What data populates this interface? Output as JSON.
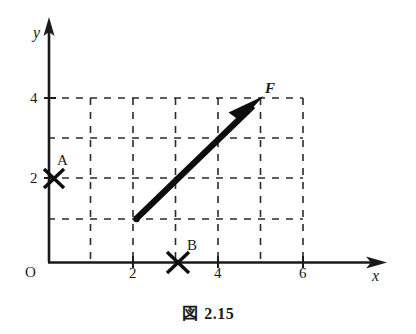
{
  "figure": {
    "caption_kanji": "図",
    "caption_number": "2.15",
    "caption_full": "図 2.15"
  },
  "axes": {
    "x_label": "x",
    "y_label": "y",
    "origin_label": "O",
    "x_ticks": [
      {
        "value": 2,
        "label": "2"
      },
      {
        "value": 4,
        "label": "4"
      },
      {
        "value": 6,
        "label": "6"
      }
    ],
    "y_ticks": [
      {
        "value": 2,
        "label": "2"
      },
      {
        "value": 4,
        "label": "4"
      }
    ],
    "x_range": [
      0,
      7.9
    ],
    "y_range": [
      0,
      5.9
    ],
    "grid": "dashed",
    "grid_x_extent": [
      0,
      6
    ],
    "grid_y_extent": [
      0,
      4
    ],
    "grid_step": 1,
    "axis_color": "#1a1a1a",
    "grid_color": "#2a2a2a"
  },
  "marks": [
    {
      "name": "A",
      "label": "A",
      "x": 0.3,
      "y": 2,
      "glyph": "x-mark"
    },
    {
      "name": "B",
      "label": "B",
      "x": 3,
      "y": 0,
      "glyph": "x-mark"
    }
  ],
  "vector": {
    "label": "F",
    "tail": {
      "x": 2,
      "y": 1
    },
    "tip": {
      "x": 5,
      "y": 4
    },
    "components": {
      "x": 3,
      "y": 3
    },
    "color": "#0d0d0d",
    "style": "thick-arrow"
  }
}
